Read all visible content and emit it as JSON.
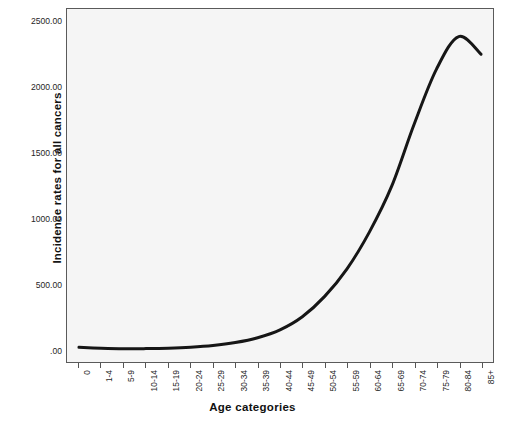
{
  "figure": {
    "background_color": "#ffffff",
    "plot_background_color": "#f5f5f5",
    "frame_color": "#5a5a5a",
    "line_color": "#161616"
  },
  "axis": {
    "x_title": "Age categories",
    "y_title": "Incidence rates for all cancers",
    "y_ticks": [
      ".00",
      "500.00",
      "1000.00",
      "1500.00",
      "2000.00",
      "2500.00"
    ],
    "y_tick_values": [
      0,
      500,
      1000,
      1500,
      2000,
      2500
    ],
    "x_ticks": [
      "0",
      "1-4",
      "5-9",
      "10-14",
      "15-19",
      "20-24",
      "25-29",
      "30-34",
      "35-39",
      "40-44",
      "45-49",
      "50-54",
      "55-59",
      "60-64",
      "65-69",
      "70-74",
      "75-79",
      "80-84",
      "85+"
    ]
  },
  "chart_data": {
    "type": "line",
    "title": "",
    "subtitle": "",
    "xlabel": "Age categories",
    "ylabel": "Incidence rates for all cancers",
    "categories": [
      "0",
      "1-4",
      "5-9",
      "10-14",
      "15-19",
      "20-24",
      "25-29",
      "30-34",
      "35-39",
      "40-44",
      "45-49",
      "50-54",
      "55-59",
      "60-64",
      "65-69",
      "70-74",
      "75-79",
      "80-84",
      "85+"
    ],
    "values": [
      22,
      15,
      11,
      12,
      15,
      22,
      35,
      58,
      95,
      155,
      255,
      410,
      620,
      900,
      1250,
      1720,
      2140,
      2390,
      2255
    ],
    "series": [
      {
        "name": "Incidence rates for all cancers",
        "values": [
          22,
          15,
          11,
          12,
          15,
          22,
          35,
          58,
          95,
          155,
          255,
          410,
          620,
          900,
          1250,
          1720,
          2140,
          2390,
          2255
        ]
      }
    ],
    "ylim": [
      -90,
      2600
    ],
    "xlim": [
      -0.5,
      18.5
    ],
    "grid": false,
    "legend": false,
    "legend_position": "none",
    "line_width": 3.0,
    "smoothed": true,
    "annotations": []
  }
}
